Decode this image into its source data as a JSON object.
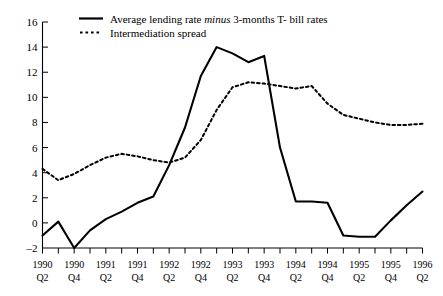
{
  "chart_data": {
    "type": "line",
    "title": "",
    "xlabel": "",
    "ylabel": "",
    "ylim": [
      -2,
      16
    ],
    "ytick_values": [
      -2,
      0,
      2,
      4,
      6,
      8,
      10,
      12,
      14,
      16
    ],
    "ytick_labels": [
      "-2",
      "0",
      "2",
      "4",
      "6",
      "8",
      "10",
      "12",
      "14",
      "16"
    ],
    "grid": false,
    "legend_position": "top-center",
    "x": [
      "1990Q2",
      "1990Q3",
      "1990Q4",
      "1991Q1",
      "1991Q2",
      "1991Q3",
      "1991Q4",
      "1992Q1",
      "1992Q2",
      "1992Q3",
      "1992Q4",
      "1993Q1",
      "1993Q2",
      "1993Q3",
      "1993Q4",
      "1994Q1",
      "1994Q2",
      "1994Q3",
      "1994Q4",
      "1995Q1",
      "1995Q2",
      "1995Q3",
      "1995Q4",
      "1996Q1",
      "1996Q2"
    ],
    "xtick_labels": [
      {
        "year": "1990",
        "quarter": "Q2"
      },
      {
        "year": "1990",
        "quarter": "Q4"
      },
      {
        "year": "1991",
        "quarter": "Q2"
      },
      {
        "year": "1991",
        "quarter": "Q4"
      },
      {
        "year": "1992",
        "quarter": "Q2"
      },
      {
        "year": "1992",
        "quarter": "Q4"
      },
      {
        "year": "1993",
        "quarter": "Q2"
      },
      {
        "year": "1993",
        "quarter": "Q4"
      },
      {
        "year": "1994",
        "quarter": "Q2"
      },
      {
        "year": "1994",
        "quarter": "Q4"
      },
      {
        "year": "1995",
        "quarter": "Q2"
      },
      {
        "year": "1995",
        "quarter": "Q4"
      },
      {
        "year": "1996",
        "quarter": "Q2"
      }
    ],
    "series": [
      {
        "name": "Average lending rate minus 3-months T- bill rates",
        "style": "solid",
        "color": "#000000",
        "values": [
          -1.0,
          0.1,
          -2.0,
          -0.6,
          0.3,
          0.9,
          1.6,
          2.1,
          4.6,
          7.6,
          11.7,
          14.0,
          13.5,
          12.8,
          13.3,
          6.0,
          1.7,
          1.7,
          1.6,
          -1.0,
          -1.1,
          -1.1,
          0.2,
          1.4,
          2.5
        ]
      },
      {
        "name": "Intermediation spread",
        "style": "dashed",
        "color": "#000000",
        "values": [
          4.3,
          3.4,
          3.9,
          4.6,
          5.2,
          5.5,
          5.3,
          5.0,
          4.8,
          5.2,
          6.6,
          9.0,
          10.8,
          11.2,
          11.1,
          10.9,
          10.7,
          10.9,
          9.5,
          8.6,
          8.3,
          8.0,
          7.8,
          7.8,
          7.9
        ]
      }
    ],
    "series_tail_solid": [
      2.5,
      3.4,
      3.9,
      3.8
    ],
    "series_tail_dashed": [
      7.9,
      7.6,
      6.6,
      5.6,
      5.3
    ]
  },
  "legend": {
    "items": [
      {
        "label_part1": "Average lending rate ",
        "label_em": "minus",
        "label_part2": " 3-months T- bill rates",
        "style": "solid"
      },
      {
        "label_part1": "Intermediation spread",
        "label_em": "",
        "label_part2": "",
        "style": "dashed"
      }
    ]
  }
}
